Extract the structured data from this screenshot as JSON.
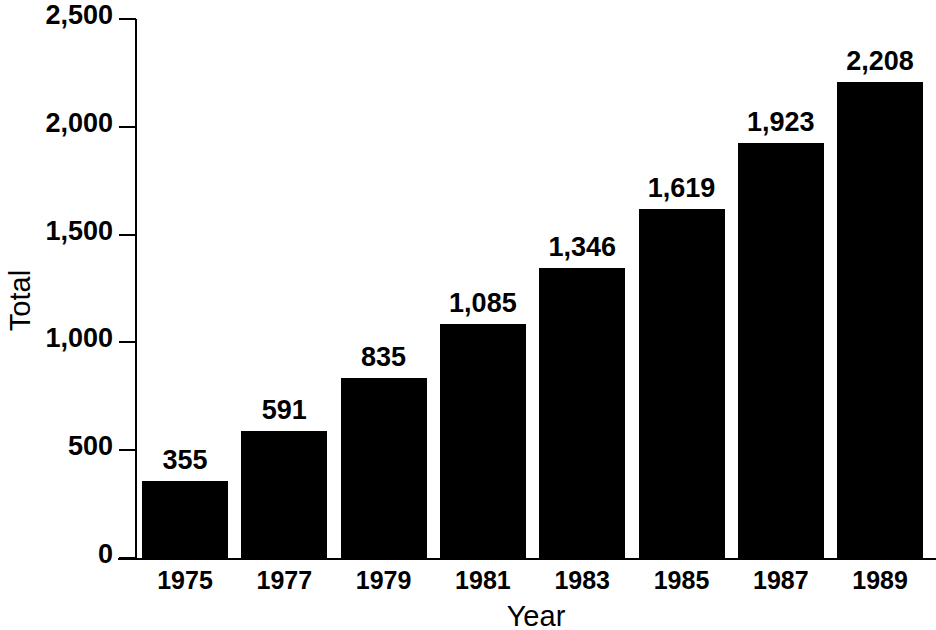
{
  "chart_data": {
    "type": "bar",
    "title": "",
    "xlabel": "Year",
    "ylabel": "Total",
    "categories": [
      "1975",
      "1977",
      "1979",
      "1981",
      "1983",
      "1985",
      "1987",
      "1989"
    ],
    "values": [
      355,
      591,
      835,
      1085,
      1346,
      1619,
      1923,
      2208
    ],
    "value_labels": [
      "355",
      "591",
      "835",
      "1,085",
      "1,346",
      "1,619",
      "1,923",
      "2,208"
    ],
    "ylim": [
      0,
      2500
    ],
    "y_ticks": [
      0,
      500,
      1000,
      1500,
      2000,
      2500
    ],
    "y_tick_labels": [
      "0",
      "500",
      "1,000",
      "1,500",
      "2,000",
      "2,500"
    ],
    "grid": false,
    "legend": null,
    "bar_color": "#000000",
    "background_color": "#ffffff",
    "text_color": "#000000"
  }
}
